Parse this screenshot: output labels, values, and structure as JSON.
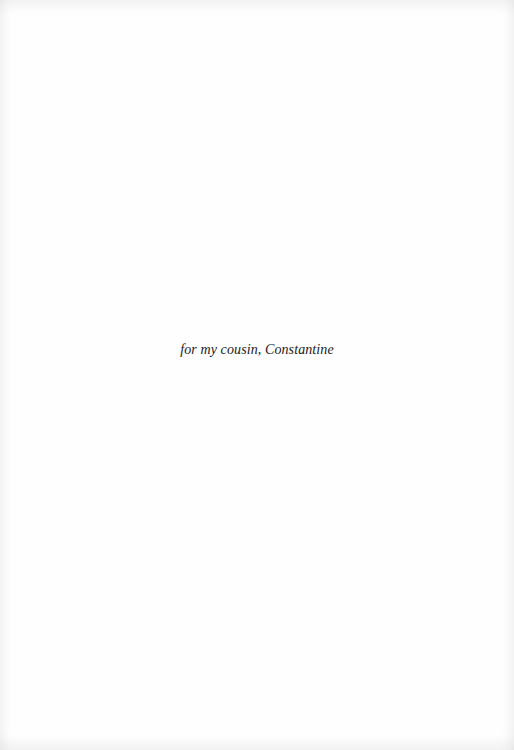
{
  "page": {
    "type": "dedication",
    "dedication_text": "for my cousin, Constantine"
  }
}
